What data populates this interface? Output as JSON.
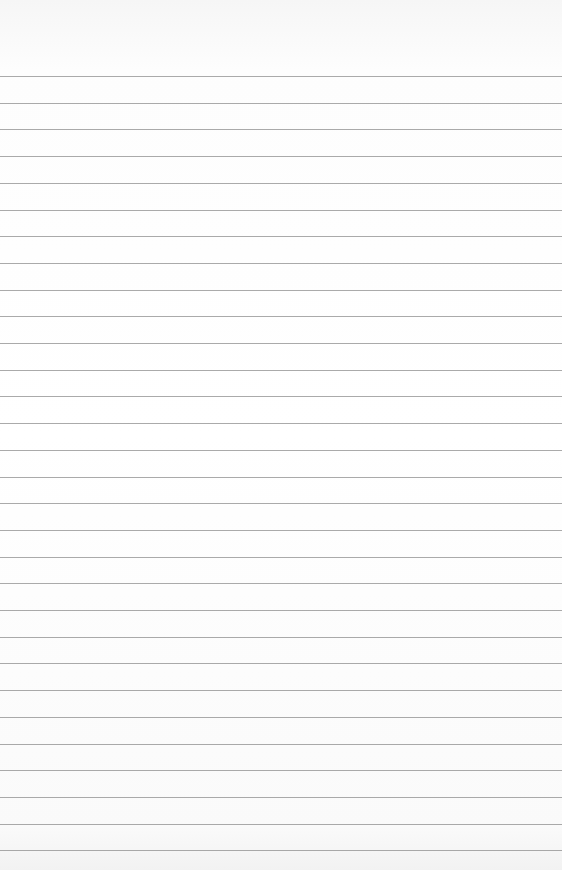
{
  "image": {
    "subject": "blank ruled notebook paper",
    "line_count": 30,
    "first_line_y": 76,
    "line_spacing": 26.7,
    "line_color": "#8d8d8d",
    "paper_color": "#ffffff"
  }
}
